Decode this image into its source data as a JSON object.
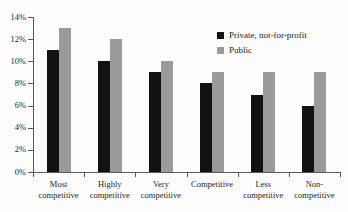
{
  "chart_data": {
    "type": "bar",
    "title": "",
    "subtitle": "",
    "xlabel": "",
    "ylabel": "",
    "ylim": [
      0,
      14
    ],
    "ytick_labels": [
      "0%",
      "2%",
      "4%",
      "6%",
      "8%",
      "10%",
      "12%",
      "14%"
    ],
    "ytick_values": [
      0,
      2,
      4,
      6,
      8,
      10,
      12,
      14
    ],
    "grid": false,
    "legend_position": "top-right",
    "value_unit": "%",
    "categories": [
      "Most competitive",
      "Highly competitive",
      "Very competitive",
      "Competitive",
      "Less competitive",
      "Non-competitive"
    ],
    "category_lines": [
      [
        "Most",
        "competitive"
      ],
      [
        "Highly",
        "competitive"
      ],
      [
        "Very",
        "competitive"
      ],
      [
        "Competitive"
      ],
      [
        "Less",
        "competitive"
      ],
      [
        "Non-",
        "competitive"
      ]
    ],
    "series": [
      {
        "name": "Private, not-for-profit",
        "color": "#121212",
        "values": [
          11,
          13,
          9,
          8,
          7,
          6
        ]
      },
      {
        "name": "Public",
        "color": "#9a9a9a",
        "values": [
          13,
          12,
          10,
          9,
          9,
          9
        ]
      }
    ]
  },
  "series_values": {
    "private": [
      11,
      10,
      9,
      8,
      7,
      6
    ],
    "public": [
      13,
      12,
      10,
      9,
      9,
      9
    ]
  },
  "legend": {
    "items": [
      {
        "label": "Private, not-for-profit",
        "color": "#121212",
        "key": "private"
      },
      {
        "label": "Public",
        "color": "#9a9a9a",
        "key": "public"
      }
    ]
  },
  "colors": {
    "private": "#121212",
    "public": "#9a9a9a",
    "axis": "#5a5a5a",
    "text": "#1a1a1a",
    "background": "#fdfdfd"
  }
}
